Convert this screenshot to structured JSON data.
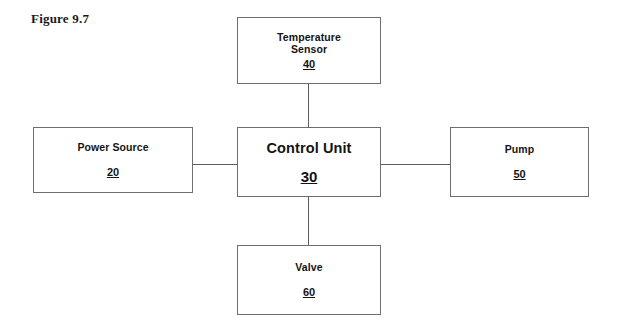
{
  "figure": {
    "caption": "Figure 9.7"
  },
  "diagram": {
    "nodes": [
      {
        "id": "temperature-sensor",
        "label": "Temperature\nSensor",
        "numeral": "40"
      },
      {
        "id": "power-source",
        "label": "Power Source",
        "numeral": "20"
      },
      {
        "id": "control-unit",
        "label": "Control Unit",
        "numeral": "30"
      },
      {
        "id": "pump",
        "label": "Pump",
        "numeral": "50"
      },
      {
        "id": "valve",
        "label": "Valve",
        "numeral": "60"
      }
    ],
    "connections": [
      {
        "id": "sensor-to-control",
        "from": "temperature-sensor",
        "to": "control-unit",
        "orientation": "vertical"
      },
      {
        "id": "power-to-control",
        "from": "power-source",
        "to": "control-unit",
        "orientation": "horizontal"
      },
      {
        "id": "control-to-pump",
        "from": "control-unit",
        "to": "pump",
        "orientation": "horizontal"
      },
      {
        "id": "control-to-valve",
        "from": "control-unit",
        "to": "valve",
        "orientation": "vertical"
      }
    ]
  },
  "colors": {
    "background": "#ffffff",
    "box_border": "#6e6e72",
    "connector": "#5c5c60",
    "text": "#141414",
    "caption_text": "#1b1b1b"
  }
}
